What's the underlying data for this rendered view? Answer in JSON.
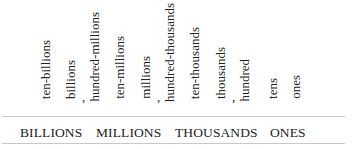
{
  "place_values": [
    {
      "label": "ten-billions",
      "x": 44,
      "bottom": 102
    },
    {
      "label": "billions",
      "x": 69,
      "bottom": 102
    },
    {
      "label": "hundred-millions",
      "x": 93,
      "bottom": 102
    },
    {
      "label": "ten-millions",
      "x": 117,
      "bottom": 102
    },
    {
      "label": "millions",
      "x": 144,
      "bottom": 102
    },
    {
      "label": "hundred-thousands",
      "x": 168,
      "bottom": 102
    },
    {
      "label": "ten-thousands",
      "x": 193,
      "bottom": 102
    },
    {
      "label": "thousands",
      "x": 220,
      "bottom": 102
    },
    {
      "label": "hundred",
      "x": 243,
      "bottom": 102
    },
    {
      "label": "tens",
      "x": 271,
      "bottom": 102
    },
    {
      "label": "ones",
      "x": 293,
      "bottom": 102
    }
  ],
  "separators": [
    {
      "text": ",",
      "x": 82
    },
    {
      "text": ",",
      "x": 158
    },
    {
      "text": ",",
      "x": 235
    }
  ],
  "periods": [
    {
      "label": "BILLIONS",
      "x": 20
    },
    {
      "label": "MILLIONS",
      "x": 96
    },
    {
      "label": "THOUSANDS",
      "x": 175
    },
    {
      "label": "ONES",
      "x": 270
    }
  ],
  "colors": {
    "text": "#222222",
    "rule": "#c8c8c8",
    "background": "#ffffff"
  }
}
